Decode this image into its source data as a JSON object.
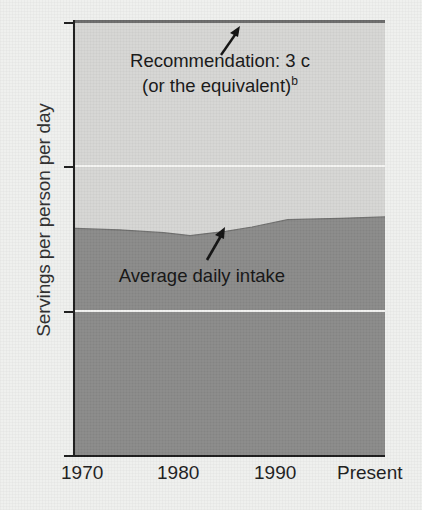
{
  "chart_data": {
    "type": "area",
    "title": "",
    "xlabel": "",
    "ylabel": "Servings per person per day",
    "ylim": [
      0,
      3
    ],
    "yticks": [
      "0",
      "1",
      "2",
      "3"
    ],
    "ytick_values": [
      0,
      1,
      2,
      3
    ],
    "xticks": [
      "1970",
      "1980",
      "1990",
      "Present"
    ],
    "xtick_values": [
      1970,
      1980,
      1990,
      2005
    ],
    "grid": "horizontal white gridlines at 1 and 2",
    "legend": "none (inline annotations)",
    "series": [
      {
        "name": "Average daily intake",
        "x": [
          1970,
          1975,
          1980,
          1983,
          1987,
          1990,
          1994,
          2000,
          2005
        ],
        "values": [
          1.57,
          1.56,
          1.54,
          1.52,
          1.55,
          1.58,
          1.63,
          1.64,
          1.65
        ],
        "color": "#8a8a89"
      },
      {
        "name": "Recommendation",
        "x": [
          1970,
          2005
        ],
        "values": [
          3.0,
          3.0
        ],
        "color": "#d6d6d4"
      }
    ],
    "annotations": [
      {
        "name": "recommendation-annotation",
        "line1": "Recommendation: 3 c",
        "line2": "(or the equivalent)",
        "footnote_marker": "b",
        "arrow": "up"
      },
      {
        "name": "intake-annotation",
        "text": "Average daily intake",
        "arrow": "up"
      }
    ]
  },
  "colors": {
    "background": "#eff0ee",
    "upper_band": "#d6d6d4",
    "lower_area": "#8a8a89",
    "gridline": "#f4f4f2",
    "axis": "#1d1d1d",
    "text": "#1d1d1d"
  }
}
